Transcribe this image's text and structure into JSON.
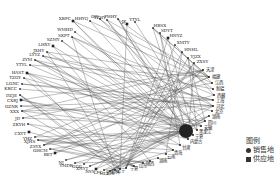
{
  "diagram": {
    "type": "circular-network",
    "center": [
      140,
      92
    ],
    "rx": 100,
    "ry": 80,
    "edge_color": "#555555",
    "node_color": "#222222",
    "hub": {
      "label": "内蒙古",
      "x": 186,
      "y": 131,
      "r": 7
    }
  },
  "supply_nodes": [
    {
      "label": "XBPC",
      "x": 73,
      "y": 21
    },
    {
      "label": "HHYQ",
      "x": 90,
      "y": 21
    },
    {
      "label": "GW",
      "x": 100,
      "y": 19
    },
    {
      "label": "YZHY",
      "x": 107,
      "y": 20
    },
    {
      "label": "FHHY",
      "x": 118,
      "y": 19
    },
    {
      "label": "JE",
      "x": 127,
      "y": 24
    },
    {
      "label": "YTYL",
      "x": 135,
      "y": 22
    },
    {
      "label": "WMHD",
      "x": 75,
      "y": 32
    },
    {
      "label": "SKPT",
      "x": 72,
      "y": 37
    },
    {
      "label": "SZMY",
      "x": 62,
      "y": 41
    },
    {
      "label": "LHXY",
      "x": 53,
      "y": 46
    },
    {
      "label": "JXHY",
      "x": 47,
      "y": 52
    },
    {
      "label": "ZYM",
      "x": 35,
      "y": 60
    },
    {
      "label": "LYYZ",
      "x": 43,
      "y": 56
    },
    {
      "label": "YTYL",
      "x": 30,
      "y": 65
    },
    {
      "label": "HAST",
      "x": 27,
      "y": 73
    },
    {
      "label": "TZGY",
      "x": 24,
      "y": 78
    },
    {
      "label": "LGNC",
      "x": 22,
      "y": 84
    },
    {
      "label": "KRCC",
      "x": 20,
      "y": 89
    },
    {
      "label": "DZJE",
      "x": 20,
      "y": 95
    },
    {
      "label": "CXRJ",
      "x": 21,
      "y": 100
    },
    {
      "label": "GZNR",
      "x": 21,
      "y": 106
    },
    {
      "label": "XXX",
      "x": 22,
      "y": 111
    },
    {
      "label": "JD",
      "x": 23,
      "y": 118
    },
    {
      "label": "ZKYH",
      "x": 28,
      "y": 124
    },
    {
      "label": "CXYT",
      "x": 29,
      "y": 132
    },
    {
      "label": "YHZ",
      "x": 35,
      "y": 137
    },
    {
      "label": "XJHS",
      "x": 38,
      "y": 140
    },
    {
      "label": "ZSYX",
      "x": 44,
      "y": 145
    },
    {
      "label": "GHCM",
      "x": 50,
      "y": 149
    },
    {
      "label": "BET",
      "x": 55,
      "y": 153
    },
    {
      "label": "NJ",
      "x": 66,
      "y": 160
    },
    {
      "label": "YMDR",
      "x": 75,
      "y": 163
    },
    {
      "label": "GGG",
      "x": 84,
      "y": 164
    },
    {
      "label": "XNYT",
      "x": 90,
      "y": 166
    },
    {
      "label": "NSY",
      "x": 96,
      "y": 169
    },
    {
      "label": "LFC",
      "x": 104,
      "y": 170
    },
    {
      "label": "MLT",
      "x": 110,
      "y": 171
    },
    {
      "label": "HBSX",
      "x": 153,
      "y": 28
    },
    {
      "label": "SDYT",
      "x": 160,
      "y": 33
    },
    {
      "label": "HNYZ",
      "x": 168,
      "y": 38
    },
    {
      "label": "XMTY",
      "x": 175,
      "y": 45
    },
    {
      "label": "HNHL",
      "x": 182,
      "y": 52
    },
    {
      "label": "YJZX",
      "x": 188,
      "y": 58
    },
    {
      "label": "ZXSY",
      "x": 194,
      "y": 63
    }
  ],
  "sales_nodes": [
    {
      "label": "天津",
      "x": 203,
      "y": 70
    },
    {
      "label": "福建",
      "x": 209,
      "y": 77
    },
    {
      "label": "江西",
      "x": 212,
      "y": 83
    },
    {
      "label": "新疆",
      "x": 213,
      "y": 89
    },
    {
      "label": "西藏",
      "x": 214,
      "y": 95
    },
    {
      "label": "上海",
      "x": 213,
      "y": 100
    },
    {
      "label": "河北",
      "x": 213,
      "y": 106
    },
    {
      "label": "北京",
      "x": 212,
      "y": 111
    },
    {
      "label": "湖南",
      "x": 209,
      "y": 116
    },
    {
      "label": "四川",
      "x": 205,
      "y": 121
    },
    {
      "label": "安徽",
      "x": 201,
      "y": 126
    },
    {
      "label": "黑龙江",
      "x": 197,
      "y": 130
    },
    {
      "label": "宁夏",
      "x": 193,
      "y": 135
    },
    {
      "label": "内蒙古",
      "x": 188,
      "y": 139
    },
    {
      "label": "甘肃",
      "x": 180,
      "y": 145
    },
    {
      "label": "青海",
      "x": 173,
      "y": 150
    },
    {
      "label": "云南",
      "x": 166,
      "y": 154
    },
    {
      "label": "湖南",
      "x": 158,
      "y": 158
    },
    {
      "label": "陕西",
      "x": 150,
      "y": 161
    },
    {
      "label": "山东",
      "x": 143,
      "y": 163
    },
    {
      "label": "宁夏",
      "x": 134,
      "y": 166
    },
    {
      "label": "辽宁",
      "x": 126,
      "y": 168
    },
    {
      "label": "吉林",
      "x": 120,
      "y": 169
    },
    {
      "label": "湖南",
      "x": 115,
      "y": 170
    }
  ],
  "legend": {
    "title": "图例",
    "items": [
      {
        "symbol": "circle",
        "label": "销售地"
      },
      {
        "symbol": "square",
        "label": "供应地"
      }
    ]
  }
}
